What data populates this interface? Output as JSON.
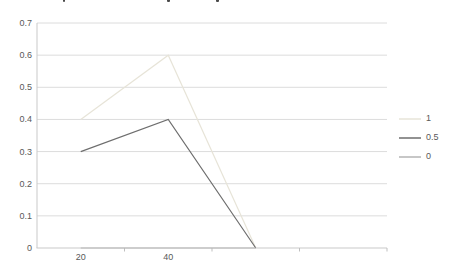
{
  "chart_data": {
    "type": "line",
    "title": "",
    "xlabel": "",
    "ylabel": "",
    "categories": [
      "20",
      "40",
      "",
      ""
    ],
    "series": [
      {
        "name": "1",
        "color": "#e7e4d8",
        "values": [
          0.4,
          0.6,
          0,
          null
        ]
      },
      {
        "name": "0.5",
        "color": "#6e6e6e",
        "values": [
          0.3,
          0.4,
          0,
          null
        ]
      },
      {
        "name": "0",
        "color": "#b5b5b5",
        "values": [
          0,
          0,
          0,
          null
        ]
      }
    ],
    "ylim": [
      0,
      0.7
    ],
    "ytick_step": 0.1,
    "ytick_labels": [
      "0",
      "0.1",
      "0.2",
      "0.3",
      "0.4",
      "0.5",
      "0.6",
      "0.7"
    ],
    "grid": true,
    "legend_position": "right",
    "legend_entries": [
      "1",
      "0.5",
      "0"
    ]
  },
  "colors": {
    "gridline": "#dcdcdc",
    "axis": "#c9c9c9",
    "tick": "#bfbfbf",
    "label_text": "#595959"
  }
}
